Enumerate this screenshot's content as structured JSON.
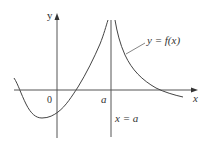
{
  "figure": {
    "type": "function-graph-vertical-asymptote",
    "labels": {
      "y_axis": "y",
      "x_axis": "x",
      "origin": "0",
      "a_tick": "a",
      "curve": "y = f(x)",
      "asymptote": "x = a"
    },
    "colors": {
      "axis": "#555555",
      "curve": "#444444",
      "asymptote": "#555555",
      "text": "#333333"
    }
  }
}
